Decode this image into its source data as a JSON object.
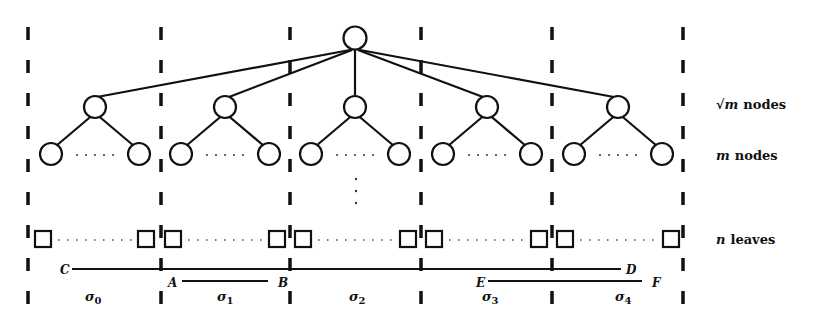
{
  "diagram": {
    "type": "tree-partition",
    "colors": {
      "ink": "#111111",
      "background": "#ffffff"
    },
    "level_labels": {
      "sqrt_m": {
        "math": "√m",
        "text": "nodes"
      },
      "m": {
        "math": "m",
        "text": "nodes"
      },
      "n": {
        "math": "n",
        "text": "leaves"
      }
    },
    "partitions": [
      {
        "label": "σ",
        "sub": "0"
      },
      {
        "label": "σ",
        "sub": "1"
      },
      {
        "label": "σ",
        "sub": "2"
      },
      {
        "label": "σ",
        "sub": "3"
      },
      {
        "label": "σ",
        "sub": "4"
      }
    ],
    "interval_points": {
      "C": "C",
      "D": "D",
      "A": "A",
      "B": "B",
      "E": "E",
      "F": "F"
    },
    "intervals": [
      {
        "name": "C-D",
        "from": "C",
        "to": "D"
      },
      {
        "name": "A-B",
        "from": "A",
        "to": "B"
      },
      {
        "name": "E-F",
        "from": "E",
        "to": "F"
      }
    ],
    "ellipsis": "· · · ·"
  }
}
